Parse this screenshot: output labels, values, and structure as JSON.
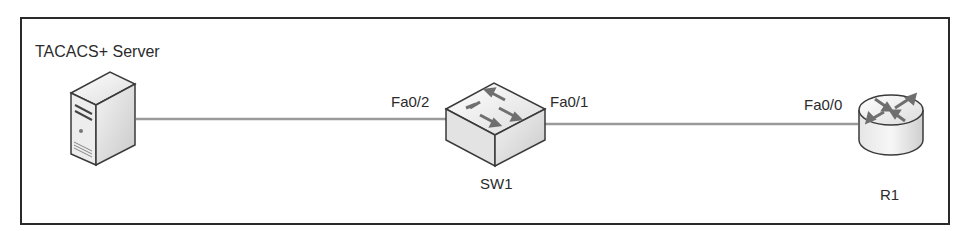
{
  "diagram": {
    "title": "",
    "nodes": [
      {
        "id": "server",
        "label": "TACACS+ Server",
        "type": "server"
      },
      {
        "id": "sw1",
        "label": "SW1",
        "type": "switch"
      },
      {
        "id": "r1",
        "label": "R1",
        "type": "router"
      }
    ],
    "links": [
      {
        "from": "server",
        "to": "sw1",
        "from_port": "",
        "to_port": "Fa0/2"
      },
      {
        "from": "sw1",
        "to": "r1",
        "from_port": "Fa0/1",
        "to_port": "Fa0/0"
      }
    ],
    "ports": {
      "sw1_left": "Fa0/2",
      "sw1_right": "Fa0/1",
      "r1_left": "Fa0/0"
    }
  },
  "colors": {
    "frame": "#2a2a2a",
    "link": "#9a9a9a",
    "device_fill": "#e8e8e8",
    "device_stroke": "#3a3a3a",
    "arrow": "#7a7a7a"
  }
}
